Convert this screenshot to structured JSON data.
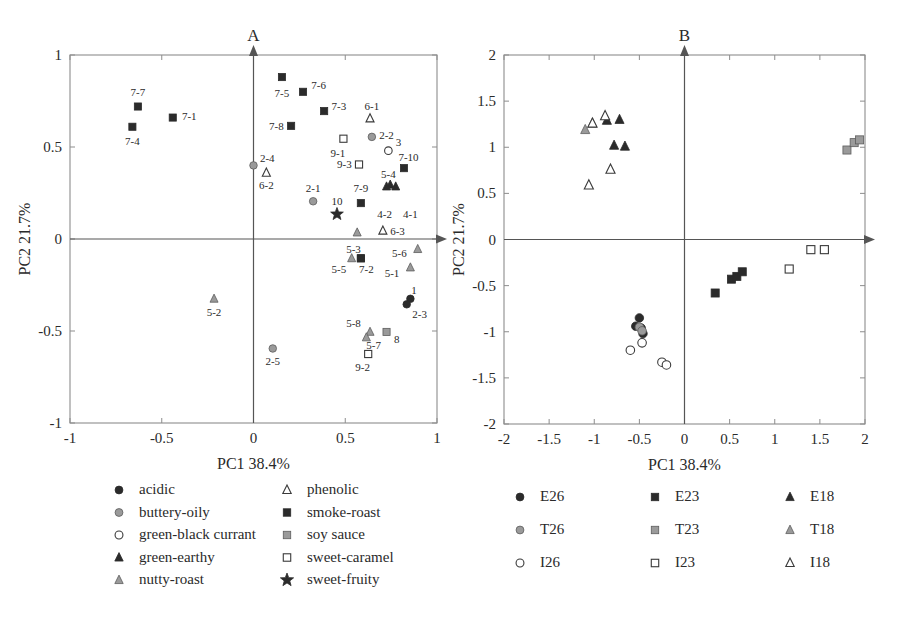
{
  "figure": {
    "panels": [
      {
        "id": "A",
        "title": "A",
        "xlabel": "PC1  38.4%",
        "ylabel": "PC2  21.7%",
        "xlim": [
          -1,
          1
        ],
        "ylim": [
          -1,
          1
        ],
        "xticks": [
          "-1",
          "-0.5",
          "0",
          "0.5",
          "1"
        ],
        "xtickvals": [
          -1,
          -0.5,
          0,
          0.5,
          1
        ],
        "yticks": [
          "-1",
          "-0.5",
          "0",
          "0.5",
          "1"
        ],
        "ytickvals": [
          -1,
          -0.5,
          0,
          0.5,
          1
        ]
      },
      {
        "id": "B",
        "title": "B",
        "xlabel": "PC1  38.4%",
        "ylabel": "PC2  21.7%",
        "xlim": [
          -2,
          2
        ],
        "ylim": [
          -2,
          2
        ],
        "xticks": [
          "-2",
          "-1.5",
          "-1",
          "-0.5",
          "0",
          "0.5",
          "1",
          "1.5",
          "2"
        ],
        "xtickvals": [
          -2,
          -1.5,
          -1,
          -0.5,
          0,
          0.5,
          1,
          1.5,
          2
        ],
        "yticks": [
          "-2",
          "-1.5",
          "-1",
          "-0.5",
          "0",
          "0.5",
          "1",
          "1.5",
          "2"
        ],
        "ytickvals": [
          -2,
          -1.5,
          -1,
          -0.5,
          0,
          0.5,
          1,
          1.5,
          2
        ]
      }
    ],
    "legend_a": {
      "items": [
        {
          "label": "acidic",
          "marker": "circle-filled-dark",
          "col": 0,
          "row": 0
        },
        {
          "label": "buttery-oily",
          "marker": "circle-filled-gray",
          "col": 0,
          "row": 1
        },
        {
          "label": "green-black currant",
          "marker": "circle-open",
          "col": 0,
          "row": 2
        },
        {
          "label": "green-earthy",
          "marker": "triangle-filled-dark",
          "col": 0,
          "row": 3
        },
        {
          "label": "nutty-roast",
          "marker": "triangle-filled-gray",
          "col": 0,
          "row": 4
        },
        {
          "label": "phenolic",
          "marker": "triangle-open",
          "col": 1,
          "row": 0
        },
        {
          "label": "smoke-roast",
          "marker": "square-filled-dark",
          "col": 1,
          "row": 1
        },
        {
          "label": "soy sauce",
          "marker": "square-filled-gray",
          "col": 1,
          "row": 2
        },
        {
          "label": "sweet-caramel",
          "marker": "square-open",
          "col": 1,
          "row": 3
        },
        {
          "label": "sweet-fruity",
          "marker": "star-filled",
          "col": 1,
          "row": 4
        }
      ]
    },
    "legend_b": {
      "items": [
        {
          "label": "E26",
          "marker": "circle-filled-dark",
          "col": 0,
          "row": 0
        },
        {
          "label": "E23",
          "marker": "square-filled-dark",
          "col": 1,
          "row": 0
        },
        {
          "label": "E18",
          "marker": "triangle-filled-dark",
          "col": 2,
          "row": 0
        },
        {
          "label": "T26",
          "marker": "circle-filled-gray",
          "col": 0,
          "row": 1
        },
        {
          "label": "T23",
          "marker": "square-filled-gray",
          "col": 1,
          "row": 1
        },
        {
          "label": "T18",
          "marker": "triangle-filled-gray",
          "col": 2,
          "row": 1
        },
        {
          "label": "I26",
          "marker": "circle-open",
          "col": 0,
          "row": 2
        },
        {
          "label": "I23",
          "marker": "square-open",
          "col": 1,
          "row": 2
        },
        {
          "label": "I18",
          "marker": "triangle-open",
          "col": 2,
          "row": 2
        }
      ]
    },
    "colors": {
      "dark": "#2b2b2b",
      "gray": "#9a9a9a",
      "open_stroke": "#3a3a3a",
      "frame": "#8d8d8d",
      "axis": "#555555",
      "text": "#2a2a2a"
    }
  },
  "chart_data": [
    {
      "type": "scatter",
      "title": "A",
      "xlabel": "PC1  38.4%",
      "ylabel": "PC2  21.7%",
      "xlim": [
        -1,
        1
      ],
      "ylim": [
        -1,
        1
      ],
      "grid": false,
      "legend_position": "below",
      "note": "PCA loadings plot of sensory attributes; each point is a panelist-attribute code.",
      "points": [
        {
          "label": "7-7",
          "x": -0.63,
          "y": 0.72,
          "marker": "square-filled-dark",
          "lx": -0.63,
          "ly": 0.8,
          "anchor": "middle"
        },
        {
          "label": "7-4",
          "x": -0.66,
          "y": 0.61,
          "marker": "square-filled-dark",
          "lx": -0.66,
          "ly": 0.53,
          "anchor": "middle"
        },
        {
          "label": "7-1",
          "x": -0.44,
          "y": 0.66,
          "marker": "square-filled-dark",
          "lx": -0.39,
          "ly": 0.67,
          "anchor": "start"
        },
        {
          "label": "2-4",
          "x": 0.0,
          "y": 0.4,
          "marker": "circle-filled-gray",
          "lx": 0.035,
          "ly": 0.44,
          "anchor": "start"
        },
        {
          "label": "6-2",
          "x": 0.07,
          "y": 0.36,
          "marker": "triangle-open",
          "lx": 0.07,
          "ly": 0.295,
          "anchor": "middle"
        },
        {
          "label": "7-5",
          "x": 0.155,
          "y": 0.88,
          "marker": "square-filled-dark",
          "lx": 0.155,
          "ly": 0.795,
          "anchor": "middle"
        },
        {
          "label": "7-6",
          "x": 0.27,
          "y": 0.8,
          "marker": "square-filled-dark",
          "lx": 0.315,
          "ly": 0.835,
          "anchor": "start"
        },
        {
          "label": "7-3",
          "x": 0.385,
          "y": 0.695,
          "marker": "square-filled-dark",
          "lx": 0.425,
          "ly": 0.725,
          "anchor": "start"
        },
        {
          "label": "7-8",
          "x": 0.205,
          "y": 0.615,
          "marker": "square-filled-dark",
          "lx": 0.165,
          "ly": 0.615,
          "anchor": "end"
        },
        {
          "label": "6-1",
          "x": 0.635,
          "y": 0.655,
          "marker": "triangle-open",
          "lx": 0.645,
          "ly": 0.725,
          "anchor": "middle"
        },
        {
          "label": "2-2",
          "x": 0.645,
          "y": 0.555,
          "marker": "circle-filled-gray",
          "lx": 0.685,
          "ly": 0.565,
          "anchor": "start"
        },
        {
          "label": "9-1",
          "x": 0.49,
          "y": 0.545,
          "marker": "square-open",
          "lx": 0.46,
          "ly": 0.465,
          "anchor": "middle"
        },
        {
          "label": "3",
          "x": 0.735,
          "y": 0.48,
          "marker": "circle-open",
          "lx": 0.775,
          "ly": 0.525,
          "anchor": "start"
        },
        {
          "label": "9-3",
          "x": 0.575,
          "y": 0.405,
          "marker": "square-open",
          "lx": 0.535,
          "ly": 0.405,
          "anchor": "end"
        },
        {
          "label": "7-10",
          "x": 0.82,
          "y": 0.385,
          "marker": "square-filled-dark",
          "lx": 0.79,
          "ly": 0.445,
          "anchor": "start"
        },
        {
          "label": "5-4",
          "x": 0.745,
          "y": 0.295,
          "marker": "triangle-filled-dark",
          "lx": 0.735,
          "ly": 0.355,
          "anchor": "middle"
        },
        {
          "label": "2-1",
          "x": 0.325,
          "y": 0.205,
          "marker": "circle-filled-gray",
          "lx": 0.325,
          "ly": 0.275,
          "anchor": "middle"
        },
        {
          "label": "7-9",
          "x": 0.585,
          "y": 0.195,
          "marker": "square-filled-dark",
          "lx": 0.585,
          "ly": 0.275,
          "anchor": "middle"
        },
        {
          "label": "10",
          "x": 0.455,
          "y": 0.135,
          "marker": "star-filled",
          "lx": 0.455,
          "ly": 0.205,
          "anchor": "middle"
        },
        {
          "label": "4-2",
          "x": 0.725,
          "y": 0.285,
          "marker": "triangle-filled-dark",
          "lx": 0.715,
          "ly": 0.135,
          "anchor": "middle"
        },
        {
          "label": "4-1",
          "x": 0.775,
          "y": 0.285,
          "marker": "triangle-filled-dark",
          "lx": 0.855,
          "ly": 0.135,
          "anchor": "middle"
        },
        {
          "label": "6-3",
          "x": 0.705,
          "y": 0.045,
          "marker": "triangle-open",
          "lx": 0.745,
          "ly": 0.045,
          "anchor": "start"
        },
        {
          "label": "5-3",
          "x": 0.565,
          "y": 0.035,
          "marker": "triangle-filled-gray",
          "lx": 0.545,
          "ly": -0.055,
          "anchor": "middle"
        },
        {
          "label": "5-6",
          "x": 0.895,
          "y": -0.055,
          "marker": "triangle-filled-gray",
          "lx": 0.835,
          "ly": -0.075,
          "anchor": "end"
        },
        {
          "label": "9-4",
          "x": 0.585,
          "y": -0.105,
          "marker": "square-filled-dark",
          "lx": 0.585,
          "ly": -0.105,
          "anchor": "middle",
          "hide_label": true
        },
        {
          "label": "5-5",
          "x": 0.535,
          "y": -0.105,
          "marker": "triangle-filled-gray",
          "lx": 0.465,
          "ly": -0.165,
          "anchor": "middle"
        },
        {
          "label": "7-2",
          "x": 0.585,
          "y": -0.105,
          "marker": "square-filled-dark",
          "lx": 0.615,
          "ly": -0.165,
          "anchor": "middle"
        },
        {
          "label": "5-1",
          "x": 0.855,
          "y": -0.155,
          "marker": "triangle-filled-gray",
          "lx": 0.795,
          "ly": -0.185,
          "anchor": "end"
        },
        {
          "label": "5-2",
          "x": -0.215,
          "y": -0.325,
          "marker": "triangle-filled-gray",
          "lx": -0.215,
          "ly": -0.395,
          "anchor": "middle"
        },
        {
          "label": "1",
          "x": 0.855,
          "y": -0.325,
          "marker": "circle-filled-dark",
          "lx": 0.875,
          "ly": -0.275,
          "anchor": "middle"
        },
        {
          "label": "2-3",
          "x": 0.835,
          "y": -0.355,
          "marker": "circle-filled-dark",
          "lx": 0.905,
          "ly": -0.405,
          "anchor": "middle"
        },
        {
          "label": "5-8",
          "x": 0.635,
          "y": -0.505,
          "marker": "triangle-filled-gray",
          "lx": 0.585,
          "ly": -0.455,
          "anchor": "end"
        },
        {
          "label": "5-7",
          "x": 0.615,
          "y": -0.535,
          "marker": "triangle-filled-gray",
          "lx": 0.655,
          "ly": -0.575,
          "anchor": "middle"
        },
        {
          "label": "8",
          "x": 0.725,
          "y": -0.505,
          "marker": "square-filled-gray",
          "lx": 0.765,
          "ly": -0.545,
          "anchor": "start"
        },
        {
          "label": "9-2",
          "x": 0.625,
          "y": -0.625,
          "marker": "square-open",
          "lx": 0.595,
          "ly": -0.695,
          "anchor": "middle"
        },
        {
          "label": "2-5",
          "x": 0.105,
          "y": -0.595,
          "marker": "circle-filled-gray",
          "lx": 0.105,
          "ly": -0.665,
          "anchor": "middle"
        }
      ]
    },
    {
      "type": "scatter",
      "title": "B",
      "xlabel": "PC1  38.4%",
      "ylabel": "PC2  21.7%",
      "xlim": [
        -2,
        2
      ],
      "ylim": [
        -2,
        2
      ],
      "grid": false,
      "legend_position": "below",
      "note": "PCA scores plot of samples grouped by treatment (E/T/I) and temperature (26/23/18).",
      "series": [
        {
          "name": "E18",
          "marker": "triangle-filled-dark",
          "points": [
            [
              -0.86,
              1.29
            ],
            [
              -0.72,
              1.3
            ],
            [
              -0.66,
              1.01
            ],
            [
              -0.78,
              1.02
            ]
          ]
        },
        {
          "name": "T18",
          "marker": "triangle-filled-gray",
          "points": [
            [
              -1.1,
              1.19
            ],
            [
              -1.02,
              1.26
            ]
          ]
        },
        {
          "name": "I18",
          "marker": "triangle-open",
          "points": [
            [
              -1.02,
              1.26
            ],
            [
              -0.88,
              1.34
            ],
            [
              -0.82,
              0.76
            ],
            [
              -1.06,
              0.59
            ]
          ]
        },
        {
          "name": "T23",
          "marker": "square-filled-gray",
          "points": [
            [
              1.8,
              0.97
            ],
            [
              1.88,
              1.05
            ],
            [
              1.94,
              1.08
            ]
          ]
        },
        {
          "name": "E23",
          "marker": "square-filled-dark",
          "points": [
            [
              0.34,
              -0.58
            ],
            [
              0.52,
              -0.43
            ],
            [
              0.58,
              -0.4
            ],
            [
              0.64,
              -0.35
            ]
          ]
        },
        {
          "name": "I23",
          "marker": "square-open",
          "points": [
            [
              1.16,
              -0.32
            ],
            [
              1.4,
              -0.11
            ],
            [
              1.55,
              -0.11
            ]
          ]
        },
        {
          "name": "E26",
          "marker": "circle-filled-dark",
          "points": [
            [
              -0.5,
              -0.85
            ],
            [
              -0.54,
              -0.94
            ],
            [
              -0.48,
              -0.96
            ],
            [
              -0.46,
              -1.02
            ]
          ]
        },
        {
          "name": "T26",
          "marker": "circle-filled-gray",
          "points": [
            [
              -0.5,
              -0.95
            ],
            [
              -0.47,
              -0.99
            ]
          ]
        },
        {
          "name": "I26",
          "marker": "circle-open",
          "points": [
            [
              -0.6,
              -1.2
            ],
            [
              -0.47,
              -1.12
            ],
            [
              -0.25,
              -1.33
            ],
            [
              -0.2,
              -1.36
            ]
          ]
        }
      ]
    }
  ]
}
